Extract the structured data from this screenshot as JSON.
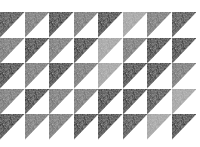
{
  "image": {
    "description": "Grid of half-square triangles with grainy grey/black tones",
    "layout": {
      "rows": 5,
      "cols": 8
    },
    "tones": {
      "black": "#111111",
      "dark": "#2e2e2e",
      "mid": "#6a6a6a",
      "light": "#9c9c9c",
      "white": "#ffffff"
    },
    "grid": [
      [
        "dark",
        "mid",
        "black",
        "mid",
        "black",
        "light",
        "mid",
        "dark"
      ],
      [
        "mid",
        "black",
        "mid",
        "black",
        "light",
        "mid",
        "black",
        "black"
      ],
      [
        "black",
        "mid",
        "black",
        "mid",
        "light",
        "black",
        "black",
        "mid"
      ],
      [
        "mid",
        "black",
        "mid",
        "mid",
        "black",
        "black",
        "dark",
        "light"
      ],
      [
        "black",
        "mid",
        "mid",
        "black",
        "black",
        "dark",
        "light",
        "black"
      ]
    ]
  }
}
